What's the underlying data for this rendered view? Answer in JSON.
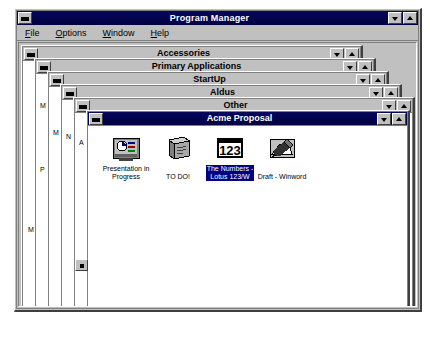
{
  "window": {
    "title": "Program Manager",
    "sysmenu_name": "system-menu",
    "minimize_label": "Minimize",
    "maximize_label": "Restore"
  },
  "menubar": {
    "items": [
      {
        "label": "File",
        "accel": "F"
      },
      {
        "label": "Options",
        "accel": "O"
      },
      {
        "label": "Window",
        "accel": "W"
      },
      {
        "label": "Help",
        "accel": "H"
      }
    ]
  },
  "groups": [
    {
      "title": "Accessories",
      "active": false,
      "peek": "M"
    },
    {
      "title": "Primary Applications",
      "active": false,
      "peek": "P"
    },
    {
      "title": "StartUp",
      "active": false,
      "peek": "M"
    },
    {
      "title": "Aldus",
      "active": false,
      "peek": "N"
    },
    {
      "title": "Other",
      "active": false,
      "peek": "A"
    },
    {
      "title": "Acme Proposal",
      "active": true,
      "peek": ""
    }
  ],
  "active_group": {
    "title": "Acme Proposal",
    "items": [
      {
        "label": "Presentation in\nProgress",
        "icon": "presentation-icon",
        "selected": false
      },
      {
        "label": "TO DO!",
        "icon": "notepad-icon",
        "selected": false
      },
      {
        "label": "The Numbers -\nLotus 123/W",
        "icon": "lotus123-icon",
        "selected": true
      },
      {
        "label": "Draft - Winword",
        "icon": "winword-icon",
        "selected": false
      }
    ]
  },
  "colors": {
    "desktop": "#ffffff",
    "face": "#c0c0c0",
    "active_title": "#000050",
    "inactive_title": "#c0c0c0",
    "selection": "#000080",
    "text": "#000000",
    "title_text": "#ffffff"
  }
}
